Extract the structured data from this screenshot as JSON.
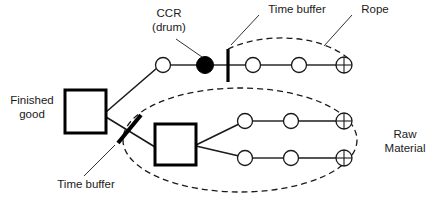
{
  "diagram": {
    "colors": {
      "stroke": "#1a1a1a",
      "drum_fill": "#000000",
      "node_fill": "#ffffff",
      "background": "#ffffff",
      "text": "#1a1a1a"
    },
    "labels": {
      "ccr_drum": "CCR\n(drum)",
      "time_buffer_top": "Time buffer",
      "rope": "Rope",
      "finished_good": "Finished\ngood",
      "time_buffer_bottom": "Time buffer",
      "raw_material": "Raw\nMaterial"
    },
    "nodes": {
      "finished_good_box": {
        "name": "finished-good-box",
        "x": 65,
        "y": 90,
        "w": 41,
        "h": 43
      },
      "assembly_box": {
        "name": "assembly-box",
        "x": 155,
        "y": 124,
        "w": 41,
        "h": 41
      },
      "ccr_drum": {
        "name": "ccr-drum-node",
        "cx": 205,
        "cy": 65,
        "r": 8,
        "fill": "solid"
      },
      "buffer_bar_top": {
        "name": "time-buffer-bar-vertical",
        "x": 228,
        "y1": 50,
        "y2": 81
      },
      "buffer_bar_diagonal": {
        "name": "time-buffer-bar-diagonal",
        "x1": 140,
        "y1": 116,
        "x2": 119,
        "y2": 142
      }
    },
    "chains": [
      {
        "name": "top-chain",
        "y": 65,
        "operations": [
          {
            "cx": 163,
            "cy": 65
          },
          {
            "cx": 253,
            "cy": 65
          },
          {
            "cx": 299,
            "cy": 65
          }
        ],
        "source": {
          "cx": 344,
          "cy": 65,
          "type": "crossed-circle"
        }
      },
      {
        "name": "middle-chain",
        "y": 121,
        "operations": [
          {
            "cx": 245,
            "cy": 121
          },
          {
            "cx": 291,
            "cy": 121
          }
        ],
        "source": {
          "cx": 344,
          "cy": 121,
          "type": "crossed-circle"
        }
      },
      {
        "name": "bottom-chain",
        "y": 158,
        "operations": [
          {
            "cx": 245,
            "cy": 158
          },
          {
            "cx": 291,
            "cy": 158
          }
        ],
        "source": {
          "cx": 344,
          "cy": 158,
          "type": "crossed-circle"
        }
      }
    ],
    "rope_arcs": [
      {
        "name": "rope-arc-top",
        "style": "dashed"
      },
      {
        "name": "rope-ellipse-bottom",
        "style": "dashed"
      }
    ],
    "leader_lines": [
      {
        "name": "leader-ccr-drum",
        "x1": 176,
        "y1": 40,
        "x2": 203,
        "y2": 57
      },
      {
        "name": "leader-time-buffer-top",
        "x1": 259,
        "y1": 14,
        "x2": 230,
        "y2": 44
      },
      {
        "name": "leader-rope",
        "x1": 352,
        "y1": 14,
        "x2": 325,
        "y2": 45
      },
      {
        "name": "leader-time-buffer-bottom",
        "x1": 83,
        "y1": 176,
        "x2": 115,
        "y2": 146
      }
    ],
    "label_positions": {
      "ccr_drum": {
        "x": 138,
        "y": 8,
        "w": 62
      },
      "time_buffer_top": {
        "x": 261,
        "y": 4,
        "w": 72
      },
      "rope": {
        "x": 354,
        "y": 4,
        "w": 42
      },
      "finished_good": {
        "x": 2,
        "y": 95,
        "w": 58
      },
      "time_buffer_bottom": {
        "x": 50,
        "y": 179,
        "w": 72
      },
      "raw_material": {
        "x": 379,
        "y": 129,
        "w": 54
      }
    }
  }
}
